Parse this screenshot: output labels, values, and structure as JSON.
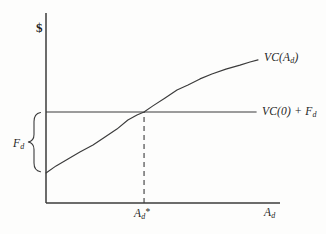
{
  "figure": {
    "y_axis_symbol": "$",
    "labels": {
      "vc_curve": {
        "pre": "VC(A",
        "sub": "d",
        "post": ")"
      },
      "vc0_line": {
        "pre": "VC(0) + F",
        "sub": "d",
        "post": ""
      },
      "fd_brace": {
        "pre": "F",
        "sub": "d",
        "post": ""
      },
      "x_star": {
        "pre": "A",
        "sub": "d",
        "post": "*"
      },
      "x_axis": {
        "pre": "A",
        "sub": "d",
        "post": ""
      }
    }
  },
  "chart_data": {
    "type": "line",
    "title": "",
    "xlabel": "A_d",
    "ylabel": "$",
    "numeric_ticks_shown": false,
    "x_range": [
      0,
      100
    ],
    "y_range": [
      0,
      100
    ],
    "line_color": "#3b3b3b",
    "series": [
      {
        "name": "VC(A_d)",
        "style": "solid",
        "points": [
          [
            0,
            15.8
          ],
          [
            4.3,
            19.5
          ],
          [
            9.4,
            23.2
          ],
          [
            14.5,
            26.8
          ],
          [
            20.1,
            30.5
          ],
          [
            25.2,
            34.7
          ],
          [
            30.3,
            38.9
          ],
          [
            35.0,
            43.7
          ],
          [
            38.9,
            46.3
          ],
          [
            41.9,
            47.9
          ],
          [
            45.7,
            51.1
          ],
          [
            50.9,
            55.3
          ],
          [
            56.0,
            59.5
          ],
          [
            60.7,
            62.1
          ],
          [
            65.8,
            65.3
          ],
          [
            70.9,
            67.9
          ],
          [
            76.9,
            70.5
          ],
          [
            82.9,
            72.6
          ],
          [
            87.2,
            74.2
          ],
          [
            90.6,
            75.3
          ]
        ]
      },
      {
        "name": "VC(0)+F_d",
        "style": "solid",
        "points": [
          [
            0,
            47.9
          ],
          [
            90,
            47.9
          ]
        ]
      }
    ],
    "annotations": [
      {
        "label": "A_d*",
        "type": "dashed_vertical_line",
        "x": 41.9,
        "y_from": 0,
        "y_to": 47.9
      },
      {
        "label": "F_d",
        "type": "brace_on_y_axis",
        "y_from": 15.8,
        "y_to": 47.9
      }
    ]
  }
}
